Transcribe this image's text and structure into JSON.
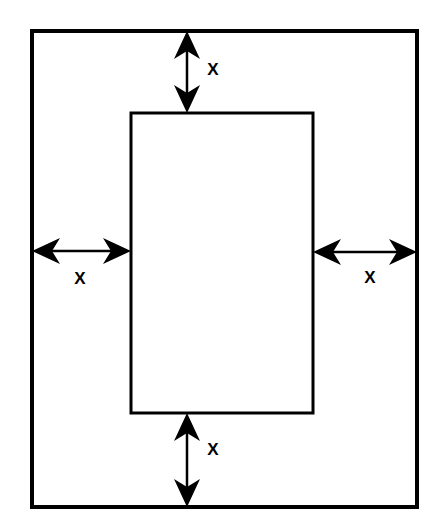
{
  "diagram": {
    "background_color": "#ffffff",
    "stroke_color": "#000000",
    "outer_rect": {
      "name": "outer-rectangle",
      "x": 32,
      "y": 31,
      "width": 385,
      "height": 476,
      "stroke_width": 4,
      "fill": "none"
    },
    "inner_rect": {
      "name": "inner-rectangle",
      "x": 131,
      "y": 113,
      "width": 182,
      "height": 300,
      "stroke_width": 3,
      "fill": "none"
    },
    "dimensions": [
      {
        "id": "top",
        "label": "X",
        "orientation": "vertical",
        "from_x": 187,
        "from_y": 31,
        "to_x": 187,
        "to_y": 113,
        "label_x": 213,
        "label_y": 71
      },
      {
        "id": "left",
        "label": "X",
        "orientation": "horizontal",
        "from_x": 32,
        "from_y": 251,
        "to_x": 131,
        "to_y": 251,
        "label_x": 80,
        "label_y": 280
      },
      {
        "id": "right",
        "label": "X",
        "orientation": "horizontal",
        "from_x": 313,
        "from_y": 252,
        "to_x": 417,
        "to_y": 252,
        "label_x": 370,
        "label_y": 279
      },
      {
        "id": "bottom",
        "label": "X",
        "orientation": "vertical",
        "from_x": 187,
        "from_y": 413,
        "to_x": 187,
        "to_y": 507,
        "label_x": 213,
        "label_y": 451
      }
    ],
    "shaft_width": 2.5,
    "arrowhead": {
      "length": 28,
      "half_width": 13,
      "notch": 8
    }
  }
}
